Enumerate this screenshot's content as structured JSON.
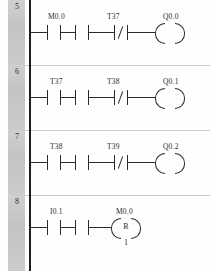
{
  "diagram": {
    "type": "ladder-logic",
    "notation": "LAD",
    "colors": {
      "background": "#fefefe",
      "rail": "#1d1d1d",
      "wire": "#2a2a2a",
      "gutter": "#c8c8c8",
      "separator": "#c9c9c9",
      "text": "#2b2b2b"
    },
    "rungs": [
      {
        "number": "5",
        "elements": [
          {
            "kind": "contact",
            "form": "normally-open",
            "label": ""
          },
          {
            "kind": "contact",
            "form": "normally-open",
            "label": "M0.0"
          },
          {
            "kind": "contact",
            "form": "normally-closed",
            "label": "T37"
          },
          {
            "kind": "coil",
            "form": "output",
            "label": "Q0.0",
            "letter": "",
            "operand": ""
          }
        ]
      },
      {
        "number": "6",
        "elements": [
          {
            "kind": "contact",
            "form": "normally-open",
            "label": ""
          },
          {
            "kind": "contact",
            "form": "normally-open",
            "label": "T37"
          },
          {
            "kind": "contact",
            "form": "normally-closed",
            "label": "T38"
          },
          {
            "kind": "coil",
            "form": "output",
            "label": "Q0.1",
            "letter": "",
            "operand": ""
          }
        ]
      },
      {
        "number": "7",
        "elements": [
          {
            "kind": "contact",
            "form": "normally-open",
            "label": ""
          },
          {
            "kind": "contact",
            "form": "normally-open",
            "label": "T38"
          },
          {
            "kind": "contact",
            "form": "normally-closed",
            "label": "T39"
          },
          {
            "kind": "coil",
            "form": "output",
            "label": "Q0.2",
            "letter": "",
            "operand": ""
          }
        ]
      },
      {
        "number": "8",
        "elements": [
          {
            "kind": "contact",
            "form": "normally-open",
            "label": ""
          },
          {
            "kind": "contact",
            "form": "normally-open",
            "label": "I0.1"
          },
          {
            "kind": "coil",
            "form": "reset",
            "label": "M0.0",
            "letter": "R",
            "operand": "1"
          }
        ]
      }
    ]
  }
}
